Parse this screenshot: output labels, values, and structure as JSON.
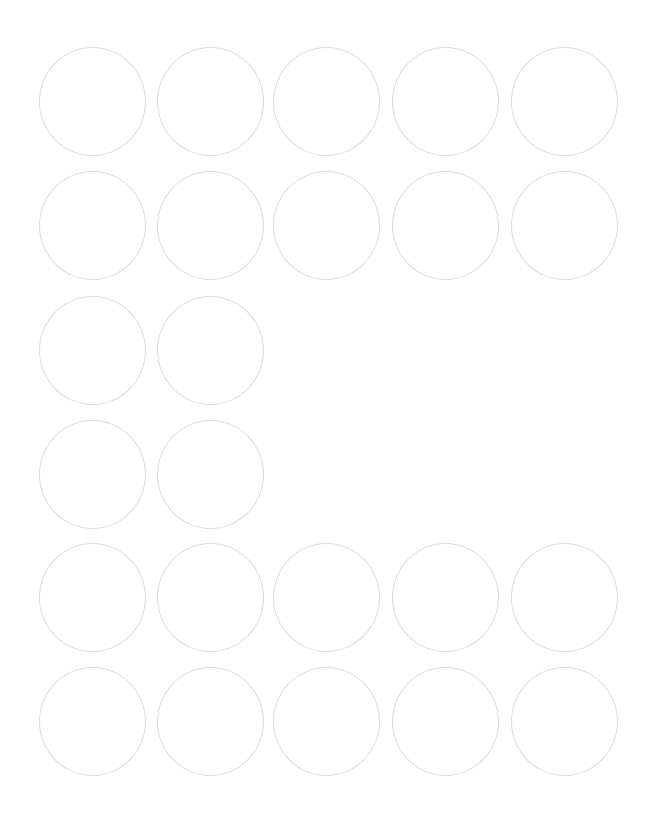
{
  "sheet": {
    "title": "",
    "background": "#ffffff",
    "stroke_color": "#dcdcdc",
    "label_shape": "circle",
    "label_diameter_px": 107,
    "columns_x": [
      39,
      157,
      273,
      392,
      511
    ],
    "rows_y": [
      47,
      171,
      296,
      420,
      543,
      667
    ],
    "rows": [
      {
        "row": 1,
        "count": 5,
        "columns": [
          1,
          2,
          3,
          4,
          5
        ]
      },
      {
        "row": 2,
        "count": 5,
        "columns": [
          1,
          2,
          3,
          4,
          5
        ]
      },
      {
        "row": 3,
        "count": 2,
        "columns": [
          1,
          2
        ]
      },
      {
        "row": 4,
        "count": 2,
        "columns": [
          1,
          2
        ]
      },
      {
        "row": 5,
        "count": 5,
        "columns": [
          1,
          2,
          3,
          4,
          5
        ]
      },
      {
        "row": 6,
        "count": 5,
        "columns": [
          1,
          2,
          3,
          4,
          5
        ]
      }
    ],
    "total_labels": 24
  }
}
